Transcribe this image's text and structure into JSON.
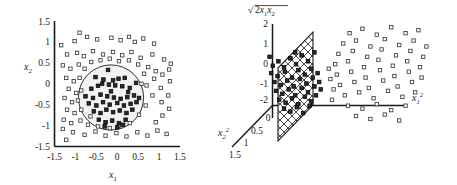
{
  "figure": {
    "caption": "",
    "background": "#ffffff",
    "ink": "#1a1a1a"
  },
  "chart_data": [
    {
      "type": "scatter",
      "panel": "left",
      "title": "",
      "xlabel": "x_1",
      "ylabel": "x_2",
      "xlim": [
        -1.5,
        1.5
      ],
      "ylim": [
        -1.5,
        1.5
      ],
      "xticks": [
        "-1.5",
        "-1",
        "-0.5",
        "0",
        "0.5",
        "1",
        "1.5"
      ],
      "yticks": [
        "1.5",
        "1",
        "0.5",
        "0",
        "-0.5",
        "-1",
        "-1.5"
      ],
      "grid": false,
      "legend": "none",
      "annotations": [
        {
          "kind": "circle",
          "label": "decision-boundary",
          "cx": -0.15,
          "cy": -0.25,
          "r": 0.78
        }
      ],
      "series": [
        {
          "name": "class-inside-filled",
          "marker": "filled-square",
          "color": "#222222",
          "points": [
            [
              -0.22,
              0.33
            ],
            [
              -0.52,
              0.16
            ],
            [
              -0.33,
              0.1
            ],
            [
              -0.1,
              0.08
            ],
            [
              0.03,
              0.12
            ],
            [
              0.18,
              0.14
            ],
            [
              0.45,
              0.02
            ],
            [
              -0.62,
              -0.12
            ],
            [
              -0.46,
              -0.05
            ],
            [
              -0.2,
              -0.02
            ],
            [
              -0.05,
              -0.04
            ],
            [
              0.12,
              -0.06
            ],
            [
              0.3,
              -0.1
            ],
            [
              -0.76,
              -0.3
            ],
            [
              -0.58,
              -0.34
            ],
            [
              -0.4,
              -0.26
            ],
            [
              -0.24,
              -0.3
            ],
            [
              -0.08,
              -0.33
            ],
            [
              0.08,
              -0.36
            ],
            [
              0.24,
              -0.32
            ],
            [
              0.4,
              -0.28
            ],
            [
              0.52,
              -0.34
            ],
            [
              -0.68,
              -0.47
            ],
            [
              -0.5,
              -0.52
            ],
            [
              -0.34,
              -0.44
            ],
            [
              -0.18,
              -0.5
            ],
            [
              0.0,
              -0.46
            ],
            [
              0.16,
              -0.52
            ],
            [
              0.32,
              -0.48
            ],
            [
              0.46,
              -0.44
            ],
            [
              -0.56,
              -0.66
            ],
            [
              -0.4,
              -0.7
            ],
            [
              -0.26,
              -0.62
            ],
            [
              -0.1,
              -0.68
            ],
            [
              0.06,
              -0.64
            ],
            [
              0.22,
              -0.7
            ],
            [
              0.36,
              -0.62
            ],
            [
              -0.44,
              -0.86
            ],
            [
              -0.28,
              -0.92
            ],
            [
              -0.12,
              -0.88
            ],
            [
              0.04,
              -0.94
            ],
            [
              0.2,
              -0.86
            ],
            [
              -0.3,
              -1.02
            ],
            [
              0.0,
              -1.04
            ],
            [
              0.14,
              -0.98
            ],
            [
              -0.15,
              -0.18
            ],
            [
              0.26,
              -0.2
            ],
            [
              -0.36,
              0.0
            ]
          ]
        },
        {
          "name": "class-outside-open",
          "marker": "open-square",
          "color": "#444444",
          "points": [
            [
              -1.02,
              1.02
            ],
            [
              -0.72,
              1.12
            ],
            [
              -0.48,
              1.06
            ],
            [
              -0.14,
              1.1
            ],
            [
              0.08,
              1.04
            ],
            [
              0.28,
              1.12
            ],
            [
              0.62,
              1.08
            ],
            [
              0.88,
              0.96
            ],
            [
              -1.2,
              0.7
            ],
            [
              -0.96,
              0.74
            ],
            [
              -0.8,
              0.66
            ],
            [
              -0.58,
              0.78
            ],
            [
              -0.34,
              0.7
            ],
            [
              -0.1,
              0.76
            ],
            [
              0.12,
              0.68
            ],
            [
              0.34,
              0.76
            ],
            [
              0.56,
              0.62
            ],
            [
              0.84,
              0.7
            ],
            [
              1.12,
              0.58
            ],
            [
              1.28,
              0.48
            ],
            [
              -1.3,
              0.44
            ],
            [
              -1.12,
              0.36
            ],
            [
              -0.92,
              0.46
            ],
            [
              -1.22,
              0.14
            ],
            [
              -1.04,
              0.06
            ],
            [
              -1.16,
              -0.12
            ],
            [
              -0.98,
              -0.22
            ],
            [
              -1.26,
              -0.34
            ],
            [
              -1.08,
              -0.44
            ],
            [
              -1.2,
              -0.62
            ],
            [
              -1.02,
              -0.7
            ],
            [
              -1.28,
              -0.86
            ],
            [
              -1.1,
              -0.94
            ],
            [
              -0.88,
              -0.88
            ],
            [
              -0.7,
              -0.98
            ],
            [
              -1.3,
              -1.08
            ],
            [
              -1.06,
              -1.16
            ],
            [
              -0.78,
              -1.22
            ],
            [
              -0.52,
              -1.14
            ],
            [
              -0.28,
              -1.24
            ],
            [
              -0.02,
              -1.18
            ],
            [
              0.22,
              -1.26
            ],
            [
              0.48,
              -1.16
            ],
            [
              0.72,
              -1.24
            ],
            [
              0.96,
              -1.12
            ],
            [
              1.18,
              -1.2
            ],
            [
              0.92,
              -0.92
            ],
            [
              1.08,
              -0.76
            ],
            [
              1.24,
              -0.6
            ],
            [
              1.06,
              -0.44
            ],
            [
              1.22,
              -0.28
            ],
            [
              1.04,
              -0.1
            ],
            [
              1.26,
              0.06
            ],
            [
              1.08,
              0.22
            ],
            [
              1.24,
              0.34
            ],
            [
              0.92,
              0.3
            ],
            [
              0.74,
              0.4
            ],
            [
              0.88,
              0.12
            ],
            [
              0.7,
              -0.04
            ],
            [
              0.84,
              -0.28
            ],
            [
              0.68,
              -0.52
            ],
            [
              0.52,
              -0.74
            ],
            [
              0.3,
              -0.94
            ],
            [
              0.04,
              -1.0
            ],
            [
              -0.18,
              -1.06
            ],
            [
              -0.46,
              -1.02
            ],
            [
              -0.64,
              -0.78
            ],
            [
              -0.86,
              -0.62
            ],
            [
              -0.94,
              -0.4
            ],
            [
              -0.86,
              -0.16
            ],
            [
              -0.9,
              0.14
            ],
            [
              -0.78,
              0.36
            ],
            [
              -0.62,
              0.52
            ],
            [
              -0.4,
              0.56
            ],
            [
              -0.18,
              0.6
            ],
            [
              0.04,
              0.54
            ],
            [
              0.28,
              0.56
            ],
            [
              0.5,
              0.46
            ],
            [
              0.64,
              0.24
            ],
            [
              0.58,
              0.0
            ],
            [
              -1.34,
              0.92
            ],
            [
              -1.22,
              -1.34
            ],
            [
              0.42,
              1.0
            ],
            [
              -0.9,
              1.22
            ]
          ]
        }
      ]
    },
    {
      "type": "scatter",
      "panel": "right",
      "projection": "3d",
      "title": "",
      "axes": [
        {
          "name": "x_1^2",
          "role": "horizontal-right"
        },
        {
          "name": "sqrt(2 x_1 x_2)",
          "role": "vertical",
          "ticks": [
            "2",
            "1",
            "0",
            "-1",
            "-2"
          ]
        },
        {
          "name": "x_2^2",
          "role": "depth-lower-left",
          "ticks": [
            "0",
            "0.5",
            "1",
            "1.5"
          ]
        }
      ],
      "annotations": [
        {
          "kind": "hatched-plane",
          "label": "separating-hyperplane"
        }
      ],
      "series": [
        {
          "name": "class-near-filled",
          "marker": "filled-square",
          "color": "#222222",
          "points": [
            [
              16,
              78
            ],
            [
              23,
              72
            ],
            [
              30,
              80
            ],
            [
              38,
              68
            ],
            [
              45,
              76
            ],
            [
              52,
              64
            ],
            [
              60,
              72
            ],
            [
              68,
              60
            ],
            [
              14,
              88
            ],
            [
              22,
              92
            ],
            [
              31,
              86
            ],
            [
              40,
              94
            ],
            [
              48,
              84
            ],
            [
              56,
              90
            ],
            [
              64,
              82
            ],
            [
              72,
              88
            ],
            [
              18,
              100
            ],
            [
              26,
              104
            ],
            [
              34,
              98
            ],
            [
              42,
              106
            ],
            [
              50,
              96
            ],
            [
              58,
              102
            ],
            [
              66,
              94
            ],
            [
              74,
              100
            ],
            [
              20,
              112
            ],
            [
              28,
              116
            ],
            [
              36,
              110
            ],
            [
              44,
              118
            ],
            [
              52,
              108
            ],
            [
              60,
              114
            ],
            [
              68,
              106
            ],
            [
              24,
              124
            ],
            [
              32,
              128
            ],
            [
              40,
              122
            ],
            [
              48,
              130
            ],
            [
              56,
              120
            ],
            [
              64,
              126
            ],
            [
              30,
              136
            ],
            [
              38,
              140
            ],
            [
              46,
              134
            ],
            [
              54,
              142
            ],
            [
              62,
              132
            ],
            [
              12,
              66
            ],
            [
              70,
              118
            ],
            [
              76,
              110
            ],
            [
              44,
              60
            ]
          ]
        },
        {
          "name": "class-far-open",
          "marker": "open-square",
          "color": "#444444",
          "points": [
            [
              112,
              34
            ],
            [
              128,
              28
            ],
            [
              146,
              36
            ],
            [
              164,
              26
            ],
            [
              182,
              34
            ],
            [
              198,
              30
            ],
            [
              104,
              48
            ],
            [
              120,
              44
            ],
            [
              138,
              52
            ],
            [
              156,
              42
            ],
            [
              174,
              50
            ],
            [
              192,
              44
            ],
            [
              208,
              52
            ],
            [
              98,
              62
            ],
            [
              116,
              58
            ],
            [
              134,
              66
            ],
            [
              152,
              56
            ],
            [
              170,
              64
            ],
            [
              188,
              58
            ],
            [
              204,
              66
            ],
            [
              94,
              76
            ],
            [
              110,
              72
            ],
            [
              130,
              80
            ],
            [
              148,
              70
            ],
            [
              166,
              78
            ],
            [
              184,
              72
            ],
            [
              200,
              80
            ],
            [
              96,
              90
            ],
            [
              114,
              86
            ],
            [
              132,
              94
            ],
            [
              150,
              84
            ],
            [
              168,
              92
            ],
            [
              186,
              86
            ],
            [
              202,
              94
            ],
            [
              100,
              104
            ],
            [
              118,
              100
            ],
            [
              136,
              108
            ],
            [
              154,
              98
            ],
            [
              172,
              106
            ],
            [
              190,
              100
            ],
            [
              106,
              118
            ],
            [
              124,
              114
            ],
            [
              142,
              122
            ],
            [
              160,
              112
            ],
            [
              178,
              120
            ],
            [
              194,
              114
            ],
            [
              110,
              132
            ],
            [
              128,
              136
            ],
            [
              146,
              130
            ],
            [
              164,
              138
            ],
            [
              182,
              132
            ],
            [
              120,
              146
            ],
            [
              138,
              150
            ],
            [
              156,
              144
            ],
            [
              174,
              152
            ],
            [
              88,
              96
            ],
            [
              92,
              110
            ],
            [
              86,
              82
            ],
            [
              90,
              124
            ]
          ]
        }
      ]
    }
  ],
  "left_panel": {
    "name": "input-space-scatter",
    "y_axis_label": "x",
    "y_axis_sub": "2",
    "x_axis_label": "x",
    "x_axis_sub": "1",
    "yticks": [
      "1.5",
      "1",
      "0.5",
      "0",
      "-0.5",
      "-1",
      "-1.5"
    ],
    "xticks": [
      "-1.5",
      "-1",
      "-0.5",
      "0",
      "0.5",
      "1",
      "1.5"
    ]
  },
  "right_panel": {
    "name": "feature-space-scatter",
    "vertical_axis_label": "2x",
    "vertical_axis_sub1": "1",
    "vertical_axis_mid": "x",
    "vertical_axis_sub2": "2",
    "vertical_ticks": [
      "2",
      "1",
      "0",
      "-1",
      "-2"
    ],
    "depth_axis_label": "x",
    "depth_axis_sub": "2",
    "depth_axis_sup": "2",
    "depth_ticks": [
      "0",
      "0.5",
      "1",
      "1.5"
    ],
    "horizontal_axis_label": "x",
    "horizontal_axis_sub": "1",
    "horizontal_axis_sup": "2"
  }
}
